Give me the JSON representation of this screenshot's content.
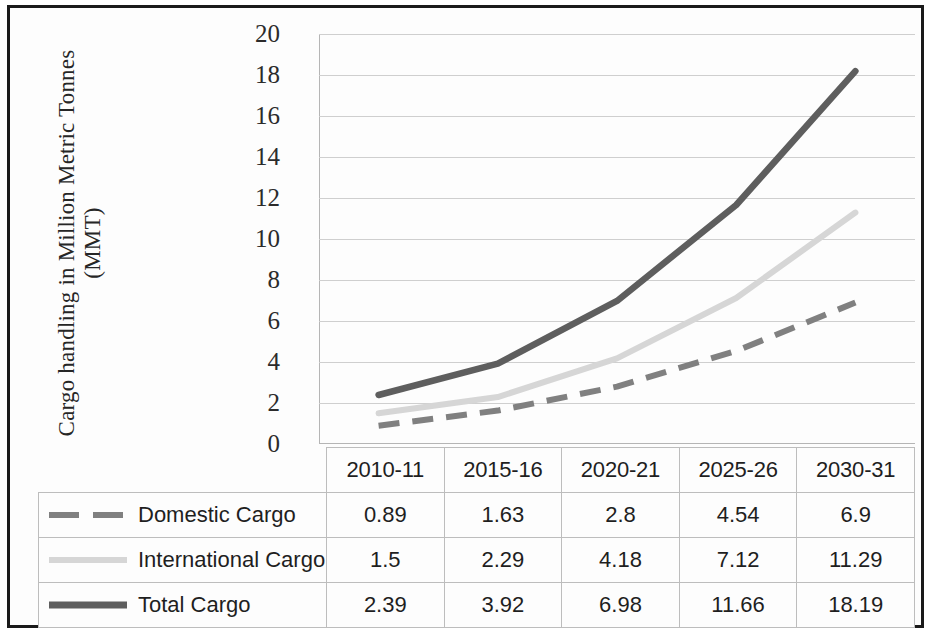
{
  "chart_data": {
    "type": "line",
    "title": "",
    "xlabel": "",
    "ylabel": "Cargo handling in Million Metric Tonnes (MMT)",
    "ylabel_line1": "Cargo handling  in Million Metric Tonnes",
    "ylabel_line2": "(MMT)",
    "categories": [
      "2010-11",
      "2015-16",
      "2020-21",
      "2025-26",
      "2030-31"
    ],
    "ylim": [
      0,
      20
    ],
    "yticks": [
      20,
      18,
      16,
      14,
      12,
      10,
      8,
      6,
      4,
      2,
      0
    ],
    "grid": true,
    "legend_position": "table-below",
    "series": [
      {
        "name": "Domestic Cargo",
        "values": [
          0.89,
          1.63,
          2.8,
          4.54,
          6.9
        ],
        "color": "#808080",
        "style": "dashed",
        "width": 6
      },
      {
        "name": "International Cargo",
        "values": [
          1.5,
          2.29,
          4.18,
          7.12,
          11.29
        ],
        "color": "#d6d6d6",
        "style": "solid",
        "width": 6
      },
      {
        "name": "Total Cargo",
        "values": [
          2.39,
          3.92,
          6.98,
          11.66,
          18.19
        ],
        "color": "#5e5e5e",
        "style": "solid",
        "width": 6.5
      }
    ]
  },
  "table": {
    "corner_label": "",
    "headers": [
      "2010-11",
      "2015-16",
      "2020-21",
      "2025-26",
      "2030-31"
    ],
    "rows": [
      {
        "label": "Domestic Cargo",
        "values": [
          "0.89",
          "1.63",
          "2.8",
          "4.54",
          "6.9"
        ]
      },
      {
        "label": "International Cargo",
        "values": [
          "1.5",
          "2.29",
          "4.18",
          "7.12",
          "11.29"
        ]
      },
      {
        "label": "Total Cargo",
        "values": [
          "2.39",
          "3.92",
          "6.98",
          "11.66",
          "18.19"
        ]
      }
    ]
  }
}
